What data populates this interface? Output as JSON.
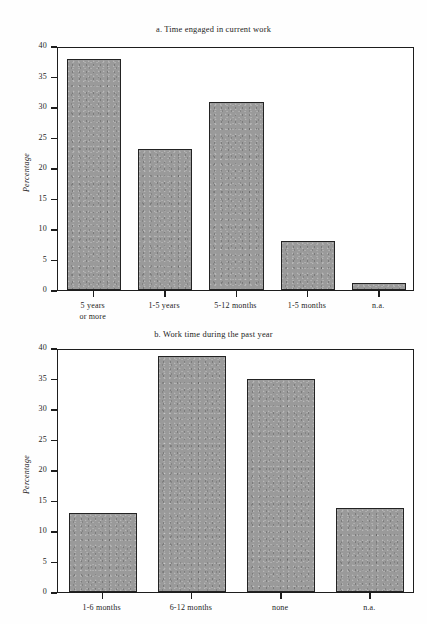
{
  "chart_data": [
    {
      "id": "a",
      "type": "bar",
      "title": "a. Time engaged in current work",
      "xlabel": "",
      "ylabel": "Percentage",
      "ylim": [
        0,
        40
      ],
      "yticks": [
        0,
        5,
        10,
        15,
        20,
        25,
        30,
        35,
        40
      ],
      "grid": false,
      "legend": null,
      "bar_color": "#9a9a9a",
      "categories": [
        "5 years\nor more",
        "1-5 years",
        "5-12 months",
        "1-5 months",
        "n.a."
      ],
      "values": [
        37.9,
        23.1,
        30.9,
        8.1,
        1.2
      ]
    },
    {
      "id": "b",
      "type": "bar",
      "title": "b. Work time during the past year",
      "xlabel": "",
      "ylabel": "Percentage",
      "ylim": [
        0,
        40
      ],
      "yticks": [
        0,
        5,
        10,
        15,
        20,
        25,
        30,
        35,
        40
      ],
      "grid": false,
      "legend": null,
      "bar_color": "#9a9a9a",
      "categories": [
        "1-6 months",
        "6-12 months",
        "none",
        "n.a."
      ],
      "values": [
        12.9,
        38.7,
        35.0,
        13.8
      ]
    }
  ]
}
